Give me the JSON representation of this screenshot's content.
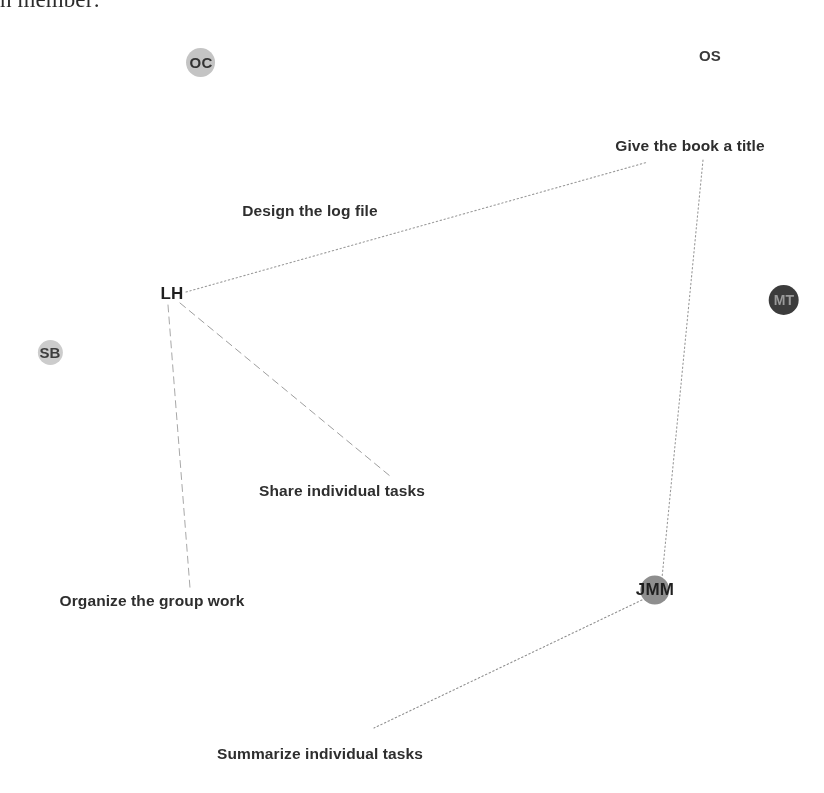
{
  "document": {
    "heading_fragment": "h member:",
    "background_color": "#ffffff",
    "width": 824,
    "height": 793
  },
  "diagram": {
    "type": "social-network-graph",
    "nodes": [
      {
        "id": "OC",
        "label": "OC",
        "x": 201,
        "y": 62,
        "disc": true,
        "disc_diameter": 29,
        "disc_color": "#c4c4c4",
        "text_color": "#333333",
        "font_size": 15
      },
      {
        "id": "OS",
        "label": "OS",
        "x": 710,
        "y": 55,
        "disc": false,
        "disc_diameter": 0,
        "disc_color": "#ffffff",
        "text_color": "#3a3a3a",
        "font_size": 15
      },
      {
        "id": "LH",
        "label": "LH",
        "x": 172,
        "y": 294,
        "disc": false,
        "disc_diameter": 0,
        "disc_color": "#ffffff",
        "text_color": "#1f1f1f",
        "font_size": 17
      },
      {
        "id": "SB",
        "label": "SB",
        "x": 50,
        "y": 352,
        "disc": true,
        "disc_diameter": 25,
        "disc_color": "#cccccc",
        "text_color": "#3d3d3d",
        "font_size": 15
      },
      {
        "id": "MT",
        "label": "MT",
        "x": 784,
        "y": 300,
        "disc": true,
        "disc_diameter": 30,
        "disc_color": "#3c3c3c",
        "text_color": "#9a9a9a",
        "font_size": 14
      },
      {
        "id": "JMM",
        "label": "JMM",
        "x": 655,
        "y": 590,
        "disc": true,
        "disc_diameter": 29,
        "disc_color": "#8e8e8e",
        "text_color": "#1f1f1f",
        "font_size": 17
      }
    ],
    "tasks": [
      {
        "id": "give-the-book-a-title",
        "label": "Give the book a title",
        "x": 690,
        "y": 146
      },
      {
        "id": "design-the-log-file",
        "label": "Design the log file",
        "x": 310,
        "y": 211
      },
      {
        "id": "share-individual-tasks",
        "label": "Share individual tasks",
        "x": 342,
        "y": 491
      },
      {
        "id": "organize-the-group-work",
        "label": "Organize the group work",
        "x": 152,
        "y": 601
      },
      {
        "id": "summarize-individual-tasks",
        "label": "Summarize individual tasks",
        "x": 320,
        "y": 754
      }
    ],
    "edges": [
      {
        "id": "lh-to-give-the-book-a-title",
        "from": "LH",
        "to": "give-the-book-a-title",
        "x1": 186,
        "y1": 292,
        "x2": 648,
        "y2": 162,
        "style": "dotted",
        "color": "#9a9a9a",
        "width": 1.1
      },
      {
        "id": "give-the-book-a-title-to-jmm",
        "from": "give-the-book-a-title",
        "to": "JMM",
        "x1": 703,
        "y1": 160,
        "x2": 662,
        "y2": 578,
        "style": "dotted",
        "color": "#9a9a9a",
        "width": 1.1
      },
      {
        "id": "lh-to-organize-the-group-work",
        "from": "LH",
        "to": "organize-the-group-work",
        "x1": 168,
        "y1": 305,
        "x2": 190,
        "y2": 588,
        "style": "dashed",
        "color": "#a8a8a8",
        "width": 1.0
      },
      {
        "id": "lh-to-share-individual-tasks",
        "from": "LH",
        "to": "share-individual-tasks",
        "x1": 180,
        "y1": 303,
        "x2": 390,
        "y2": 476,
        "style": "dashed",
        "color": "#9e9e9e",
        "width": 1.0
      },
      {
        "id": "jmm-to-summarize-individual-tasks",
        "from": "JMM",
        "to": "summarize-individual-tasks",
        "x1": 642,
        "y1": 600,
        "x2": 374,
        "y2": 728,
        "style": "dotted",
        "color": "#8f8f8f",
        "width": 1.1
      }
    ]
  }
}
